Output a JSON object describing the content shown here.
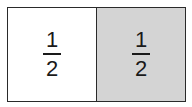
{
  "diagram": {
    "parts": [
      {
        "numerator": "1",
        "denominator": "2",
        "fill": "#ffffff",
        "shaded": false
      },
      {
        "numerator": "1",
        "denominator": "2",
        "fill": "#d4d4d4",
        "shaded": true
      }
    ],
    "border_color": "#2a2a2a"
  }
}
